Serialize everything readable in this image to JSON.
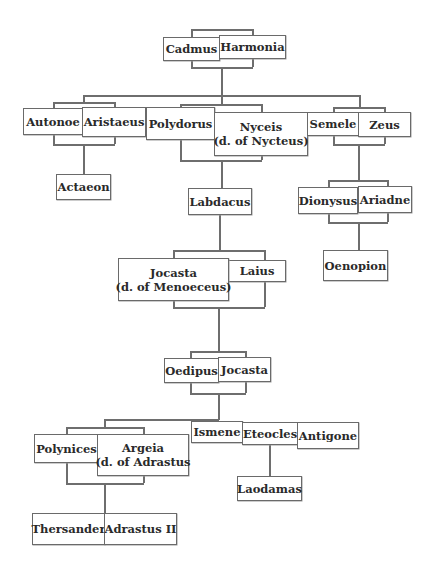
{
  "diagram": {
    "type": "family-tree",
    "nodes": {
      "cadmus": "Cadmus",
      "harmonia": "Harmonia",
      "autonoe": "Autonoe",
      "aristaeus": "Aristaeus",
      "polydorus": "Polydorus",
      "nyceis_name": "Nyceis",
      "nyceis_note": "(d. of Nycteus)",
      "semele": "Semele",
      "zeus": "Zeus",
      "actaeon": "Actaeon",
      "labdacus": "Labdacus",
      "dionysus": "Dionysus",
      "ariadne": "Ariadne",
      "jocasta1_name": "Jocasta",
      "jocasta1_note": "(d. of Menoeceus)",
      "laius": "Laius",
      "oenopion": "Oenopion",
      "oedipus": "Oedipus",
      "jocasta2": "Jocasta",
      "polynices": "Polynices",
      "argeia_name": "Argeia",
      "argeia_note": "(d. of Adrastus",
      "ismene": "Ismene",
      "eteocles": "Eteocles",
      "antigone": "Antigone",
      "laodamas": "Laodamas",
      "thersander": "Thersander",
      "adrastus2": "Adrastus II"
    },
    "couples": [
      [
        "Cadmus",
        "Harmonia"
      ],
      [
        "Autonoe",
        "Aristaeus"
      ],
      [
        "Polydorus",
        "Nyceis (d. of Nycteus)"
      ],
      [
        "Semele",
        "Zeus"
      ],
      [
        "Dionysus",
        "Ariadne"
      ],
      [
        "Jocasta (d. of Menoeceus)",
        "Laius"
      ],
      [
        "Oedipus",
        "Jocasta"
      ],
      [
        "Polynices",
        "Argeia (d. of Adrastus"
      ],
      [
        "Thersander",
        "Adrastus II"
      ]
    ],
    "descent": [
      {
        "parents": [
          "Cadmus",
          "Harmonia"
        ],
        "children": [
          "Autonoe",
          "Polydorus",
          "Semele"
        ]
      },
      {
        "parents": [
          "Autonoe",
          "Aristaeus"
        ],
        "children": [
          "Actaeon"
        ]
      },
      {
        "parents": [
          "Polydorus",
          "Nyceis"
        ],
        "children": [
          "Labdacus"
        ]
      },
      {
        "parents": [
          "Semele",
          "Zeus"
        ],
        "children": [
          "Dionysus"
        ]
      },
      {
        "parents": [
          "Dionysus",
          "Ariadne"
        ],
        "children": [
          "Oenopion"
        ]
      },
      {
        "parents": [
          "Labdacus"
        ],
        "children": [
          "Laius"
        ]
      },
      {
        "parents": [
          "Jocasta",
          "Laius"
        ],
        "children": [
          "Oedipus"
        ]
      },
      {
        "parents": [
          "Oedipus",
          "Jocasta"
        ],
        "children": [
          "Polynices",
          "Ismene",
          "Eteocles",
          "Antigone"
        ]
      },
      {
        "parents": [
          "Eteocles"
        ],
        "children": [
          "Laodamas"
        ]
      },
      {
        "parents": [
          "Polynices",
          "Argeia"
        ],
        "children": [
          "Thersander",
          "Adrastus II"
        ]
      }
    ],
    "colors": {
      "line": "#6e6e6e",
      "box_border": "#6a6a6a",
      "text": "#2a2a2a",
      "background": "#ffffff"
    }
  }
}
